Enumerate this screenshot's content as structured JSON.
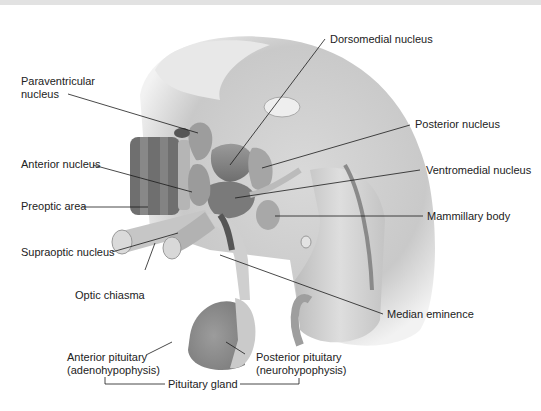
{
  "figure": {
    "colors": {
      "background": "#ffffff",
      "label_text": "#222222",
      "leader_line": "#1a1a1a",
      "top_bar": "#e2e2e2"
    }
  },
  "labels": {
    "paraventricular": "Paraventricular",
    "paraventricular_2": "nucleus",
    "anterior_nucleus": "Anterior nucleus",
    "preoptic_area": "Preoptic area",
    "supraoptic_nucleus": "Supraoptic nucleus",
    "optic_chiasma": "Optic chiasma",
    "anterior_pituitary": "Anterior pituitary",
    "adenohypophysis": "(adenohypophysis)",
    "pituitary_gland": "Pituitary gland",
    "posterior_pituitary": "Posterior pituitary",
    "neurohypophysis": "(neurohypophysis)",
    "dorsomedial_nucleus": "Dorsomedial nucleus",
    "posterior_nucleus": "Posterior nucleus",
    "ventromedial_nucleus": "Ventromedial nucleus",
    "mammillary_body": "Mammillary body",
    "median_eminence": "Median eminence"
  }
}
